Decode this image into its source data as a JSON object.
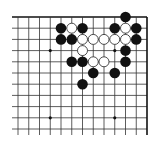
{
  "diagram": {
    "type": "go-board-fragment",
    "corner": "top-right",
    "columns": 13,
    "rows": 11,
    "grid": {
      "x0": 18,
      "dx": 10.75,
      "y0": 17,
      "dy": 11.2,
      "left_extend_to": 12,
      "bottom_extend_to": 135
    },
    "colors": {
      "line": "#333333",
      "edge": "#111111",
      "black_stone": "#111111",
      "white_stone": "#ffffff",
      "white_outline": "#222222",
      "background": "#ffffff"
    },
    "star_points": [
      [
        3,
        3
      ],
      [
        9,
        3
      ],
      [
        3,
        9
      ],
      [
        9,
        9
      ]
    ],
    "stones": [
      {
        "color": "black",
        "col": 10,
        "row": 0
      },
      {
        "color": "black",
        "col": 4,
        "row": 1
      },
      {
        "color": "white",
        "col": 5,
        "row": 1
      },
      {
        "color": "black",
        "col": 6,
        "row": 1
      },
      {
        "color": "black",
        "col": 9,
        "row": 1
      },
      {
        "color": "white",
        "col": 10,
        "row": 1
      },
      {
        "color": "black",
        "col": 11,
        "row": 1
      },
      {
        "color": "black",
        "col": 4,
        "row": 2
      },
      {
        "color": "black",
        "col": 5,
        "row": 2
      },
      {
        "color": "white",
        "col": 6,
        "row": 2
      },
      {
        "color": "white",
        "col": 7,
        "row": 2
      },
      {
        "color": "white",
        "col": 8,
        "row": 2
      },
      {
        "color": "white",
        "col": 9,
        "row": 2
      },
      {
        "color": "white",
        "col": 10,
        "row": 2
      },
      {
        "color": "black",
        "col": 11,
        "row": 2
      },
      {
        "color": "white",
        "col": 6,
        "row": 3
      },
      {
        "color": "black",
        "col": 10,
        "row": 3
      },
      {
        "color": "black",
        "col": 5,
        "row": 4
      },
      {
        "color": "black",
        "col": 6,
        "row": 4
      },
      {
        "color": "white",
        "col": 7,
        "row": 4
      },
      {
        "color": "white",
        "col": 8,
        "row": 4
      },
      {
        "color": "black",
        "col": 10,
        "row": 4
      },
      {
        "color": "black",
        "col": 7,
        "row": 5
      },
      {
        "color": "black",
        "col": 9,
        "row": 5
      },
      {
        "color": "black",
        "col": 6,
        "row": 6
      }
    ]
  }
}
